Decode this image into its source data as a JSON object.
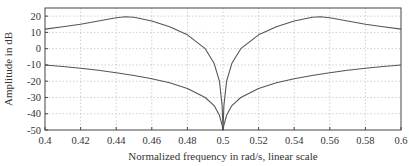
{
  "chart_data": {
    "type": "line",
    "title": "",
    "xlabel": "Normalized frequency in rad/s, linear scale",
    "ylabel": "Amplitude in dB",
    "xlim": [
      0.4,
      0.6
    ],
    "ylim": [
      -50,
      25
    ],
    "xticks": [
      0.4,
      0.42,
      0.44,
      0.46,
      0.48,
      0.5,
      0.52,
      0.54,
      0.56,
      0.58,
      0.6
    ],
    "xtick_labels": [
      "0.4",
      "0.42",
      "0.44",
      "0.46",
      "0.48",
      "0.5",
      "0.52",
      "0.54",
      "0.56",
      "0.58",
      "0.6"
    ],
    "yticks": [
      20,
      10,
      0,
      -10,
      -20,
      -30,
      -40,
      -50
    ],
    "ytick_labels": [
      "20",
      "10",
      "0",
      "-10",
      "-20",
      "-30",
      "-40",
      "-50"
    ],
    "grid": true,
    "legend": null,
    "series": [
      {
        "name": "upper",
        "color": "#555555",
        "x": [
          0.4,
          0.41,
          0.42,
          0.43,
          0.44,
          0.445,
          0.45,
          0.46,
          0.47,
          0.48,
          0.49,
          0.495,
          0.498,
          0.4995,
          0.5,
          0.5005,
          0.502,
          0.505,
          0.51,
          0.52,
          0.53,
          0.54,
          0.55,
          0.555,
          0.56,
          0.57,
          0.58,
          0.59,
          0.6
        ],
        "y": [
          12,
          13.5,
          15,
          17,
          19,
          19.6,
          19.3,
          17,
          13.5,
          8.5,
          0,
          -9,
          -20,
          -35,
          -50,
          -35,
          -20,
          -9,
          0,
          8.5,
          13.5,
          17,
          19.3,
          19.6,
          19,
          17,
          15,
          13.5,
          12
        ]
      },
      {
        "name": "lower",
        "color": "#555555",
        "x": [
          0.4,
          0.41,
          0.42,
          0.43,
          0.44,
          0.45,
          0.46,
          0.47,
          0.48,
          0.49,
          0.495,
          0.498,
          0.4995,
          0.5,
          0.5005,
          0.502,
          0.505,
          0.51,
          0.52,
          0.53,
          0.54,
          0.55,
          0.56,
          0.57,
          0.58,
          0.59,
          0.6
        ],
        "y": [
          -10,
          -11,
          -12,
          -13.3,
          -14.8,
          -16.5,
          -18.5,
          -21,
          -24.5,
          -30,
          -35,
          -41,
          -47,
          -50,
          -47,
          -41,
          -35,
          -30,
          -24.5,
          -21,
          -18.5,
          -16.5,
          -14.8,
          -13.3,
          -12,
          -11,
          -10
        ]
      }
    ]
  },
  "colors": {
    "line": "#555555",
    "grid": "#bbbbbb",
    "axis": "#444444",
    "background": "#ffffff"
  }
}
